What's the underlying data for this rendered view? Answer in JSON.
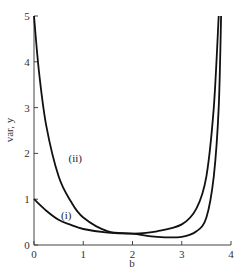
{
  "chart_data": {
    "type": "line",
    "title": "",
    "xlabel": "b",
    "ylabel": "var, y",
    "xlim": [
      0,
      4
    ],
    "ylim": [
      0,
      5
    ],
    "x_ticks": [
      "0",
      "1",
      "2",
      "3",
      "4"
    ],
    "y_ticks": [
      "0",
      "1",
      "2",
      "3",
      "4",
      "5"
    ],
    "grid": false,
    "legend": "inline curve labels",
    "series": [
      {
        "name": "(i)",
        "x": [
          0,
          0.25,
          0.5,
          0.75,
          1,
          1.5,
          2,
          2.5,
          3,
          3.3,
          3.5,
          3.65,
          3.75
        ],
        "y": [
          1.0,
          0.75,
          0.55,
          0.44,
          0.35,
          0.27,
          0.25,
          0.3,
          0.45,
          0.8,
          1.5,
          3.0,
          5.0
        ]
      },
      {
        "name": "(ii)",
        "x": [
          0,
          0.1,
          0.25,
          0.5,
          0.75,
          1,
          1.5,
          2,
          2.5,
          3,
          3.3,
          3.5,
          3.65,
          3.75,
          3.8
        ],
        "y": [
          5.0,
          3.8,
          2.6,
          1.5,
          0.95,
          0.6,
          0.3,
          0.25,
          0.18,
          0.18,
          0.3,
          0.6,
          1.5,
          3.0,
          5.0
        ]
      }
    ],
    "annotations": [
      {
        "text": "(i)",
        "x": 0.55,
        "y": 0.65
      },
      {
        "text": "(ii)",
        "x": 0.7,
        "y": 1.9
      }
    ]
  }
}
